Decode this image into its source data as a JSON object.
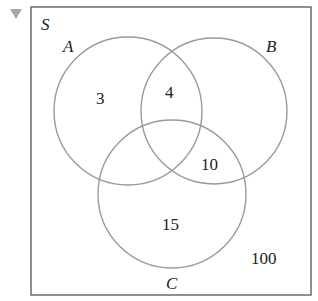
{
  "collapse_toggle": {
    "icon": "triangle-down-icon",
    "color": "#a0a0a0"
  },
  "venn": {
    "universe_label": "S",
    "sets": [
      {
        "name": "A",
        "cx": 128,
        "cy": 111,
        "r": 74
      },
      {
        "name": "B",
        "cx": 214,
        "cy": 111,
        "r": 73
      },
      {
        "name": "C",
        "cx": 172,
        "cy": 194,
        "r": 74
      }
    ],
    "regions": [
      {
        "label": "A only",
        "value": "3"
      },
      {
        "label": "A and B only",
        "value": "4"
      },
      {
        "label": "B and C only",
        "value": "10"
      },
      {
        "label": "C only",
        "value": "15"
      },
      {
        "label": "outside all",
        "value": "100"
      }
    ],
    "circle_color": "#9a9a9a",
    "border_color": "#555555"
  }
}
